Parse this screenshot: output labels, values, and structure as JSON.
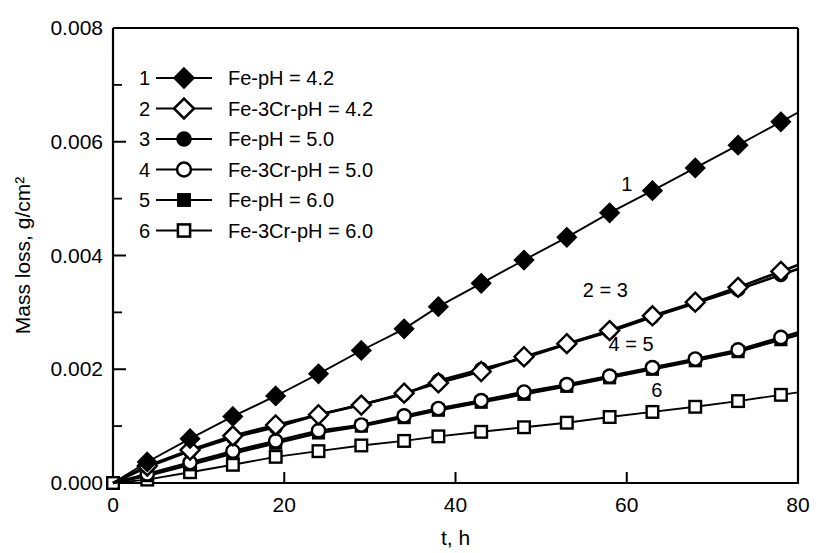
{
  "chart_data": {
    "type": "line",
    "title": "",
    "xlabel": "t, h",
    "ylabel": "Mass loss, g/cm²",
    "xlim": [
      0,
      80
    ],
    "ylim": [
      0.0,
      0.008
    ],
    "xticks": [
      "0",
      "20",
      "40",
      "60",
      "80"
    ],
    "xtick_values": [
      0,
      20,
      40,
      60,
      80
    ],
    "yticks": [
      "0.000",
      "0.002",
      "0.004",
      "0.006",
      "0.008"
    ],
    "ytick_values": [
      0.0,
      0.002,
      0.004,
      0.006,
      0.008
    ],
    "yminor_values": [
      0.001,
      0.003,
      0.005,
      0.007
    ],
    "grid": false,
    "legend_position": "upper-left-inside",
    "x": [
      0,
      4,
      9,
      14,
      19,
      24,
      29,
      34,
      38,
      43,
      48,
      53,
      58,
      63,
      68,
      73,
      78
    ],
    "series": [
      {
        "number": "1",
        "name": "Fe-pH = 4.2",
        "marker": "filled-diamond",
        "values": [
          0.0,
          0.00037,
          0.00078,
          0.00117,
          0.00153,
          0.00192,
          0.00233,
          0.00271,
          0.0031,
          0.00351,
          0.00392,
          0.00432,
          0.00475,
          0.00514,
          0.00554,
          0.00594,
          0.00635
        ],
        "curve_label": "1"
      },
      {
        "number": "2",
        "name": "Fe-3Cr-pH = 4.2",
        "marker": "open-diamond",
        "values": [
          0.0,
          0.0003,
          0.00058,
          0.00083,
          0.00102,
          0.0012,
          0.00137,
          0.00158,
          0.00176,
          0.00196,
          0.00222,
          0.00245,
          0.00268,
          0.00294,
          0.00318,
          0.00344,
          0.00372
        ],
        "curve_label": "2 = 3"
      },
      {
        "number": "3",
        "name": "Fe-pH = 5.0",
        "marker": "filled-circle",
        "values": [
          0.0,
          0.00028,
          0.00056,
          0.0008,
          0.00098,
          0.0012,
          0.00138,
          0.00156,
          0.0018,
          0.002,
          0.0022,
          0.00244,
          0.00266,
          0.00292,
          0.00316,
          0.0034,
          0.00366
        ],
        "curve_label": ""
      },
      {
        "number": "4",
        "name": "Fe-3Cr-pH = 5.0",
        "marker": "open-circle",
        "values": [
          0.0,
          0.00016,
          0.00036,
          0.00056,
          0.00074,
          0.00092,
          0.00102,
          0.00118,
          0.00131,
          0.00145,
          0.0016,
          0.00173,
          0.00188,
          0.00203,
          0.00218,
          0.00234,
          0.00256
        ],
        "curve_label": "4 = 5"
      },
      {
        "number": "5",
        "name": "Fe-pH = 6.0",
        "marker": "filled-square",
        "values": [
          0.0,
          0.00013,
          0.00032,
          0.00052,
          0.0007,
          0.00088,
          0.001,
          0.00115,
          0.00128,
          0.00142,
          0.00156,
          0.0017,
          0.00185,
          0.002,
          0.00215,
          0.00231,
          0.00252
        ],
        "curve_label": ""
      },
      {
        "number": "6",
        "name": "Fe-3Cr-pH = 6.0",
        "marker": "open-square",
        "values": [
          0.0,
          6e-05,
          0.00019,
          0.00032,
          0.00046,
          0.00056,
          0.00066,
          0.00074,
          0.00082,
          0.0009,
          0.00098,
          0.00106,
          0.00116,
          0.00125,
          0.00134,
          0.00144,
          0.00155
        ],
        "curve_label": "6"
      }
    ],
    "colors": {
      "line": "#000000",
      "marker_fill": "#000000",
      "marker_open": "#ffffff",
      "background": "#ffffff"
    }
  },
  "legend": {
    "rows": [
      {
        "number": "1",
        "label": "Fe-pH = 4.2"
      },
      {
        "number": "2",
        "label": "Fe-3Cr-pH = 4.2"
      },
      {
        "number": "3",
        "label": "Fe-pH = 5.0"
      },
      {
        "number": "4",
        "label": "Fe-3Cr-pH = 5.0"
      },
      {
        "number": "5",
        "label": "Fe-pH = 6.0"
      },
      {
        "number": "6",
        "label": "Fe-3Cr-pH = 6.0"
      }
    ]
  },
  "annotations": [
    {
      "text": "1",
      "x": 60,
      "y": 0.00513
    },
    {
      "text": "2 = 3",
      "x": 57.5,
      "y": 0.00327
    },
    {
      "text": "4 = 5",
      "x": 60.5,
      "y": 0.00232
    },
    {
      "text": "6",
      "x": 63.5,
      "y": 0.00152
    }
  ]
}
